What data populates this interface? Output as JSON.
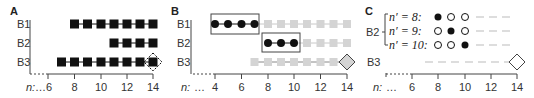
{
  "panels": [
    {
      "id": "A",
      "label": "A",
      "rows": [
        "B1",
        "B2",
        "B3"
      ],
      "axis_prefix": "n:",
      "axis_ticks": [
        "…6",
        "8",
        "10",
        "12",
        "14"
      ],
      "series": [
        {
          "row": "B1",
          "marker": "square-black",
          "from": 8,
          "to": 14
        },
        {
          "row": "B2",
          "marker": "square-black",
          "from": 11,
          "to": 14
        },
        {
          "row": "B3",
          "marker": "square-black",
          "from": 7,
          "to": 14,
          "end_marker": "diamond-dashed"
        }
      ]
    },
    {
      "id": "B",
      "label": "B",
      "rows": [
        "B1",
        "B2",
        "B3"
      ],
      "axis_prefix": "n:",
      "axis_ellipsis": "…",
      "axis_ticks": [
        "4",
        "6",
        "8",
        "10",
        "12",
        "14"
      ],
      "series": [
        {
          "row": "B1",
          "highlight": {
            "marker": "circle-black",
            "from": 4,
            "to": 7,
            "boxed": true
          },
          "rest": {
            "marker": "square-gray",
            "from": 8,
            "to": 14
          }
        },
        {
          "row": "B2",
          "highlight": {
            "marker": "circle-black",
            "from": 8,
            "to": 10,
            "boxed": true
          },
          "rest": {
            "marker": "square-gray",
            "from": 11,
            "to": 14
          }
        },
        {
          "row": "B3",
          "rest": {
            "marker": "square-gray",
            "from": 7,
            "to": 13
          },
          "end_marker": "diamond-gray"
        }
      ]
    },
    {
      "id": "C",
      "label": "C",
      "group_label": "B2",
      "sub_rows": [
        {
          "label": "n′ = 8:",
          "circles": [
            "filled",
            "open",
            "open"
          ]
        },
        {
          "label": "n′ = 9:",
          "circles": [
            "open",
            "filled",
            "open"
          ]
        },
        {
          "label": "n′ = 10:",
          "circles": [
            "open",
            "open",
            "filled"
          ]
        }
      ],
      "row_b3": "B3",
      "axis_prefix": "n:",
      "axis_ellipsis": "…",
      "axis_ticks": [
        "6",
        "8",
        "10",
        "12",
        "14"
      ],
      "b3_end_marker": "diamond-open"
    }
  ],
  "colors": {
    "black": "#111111",
    "gray_marker": "#d4d4d4",
    "gray_line": "#c8c8c8",
    "axis": "#444444",
    "text": "#333333"
  }
}
